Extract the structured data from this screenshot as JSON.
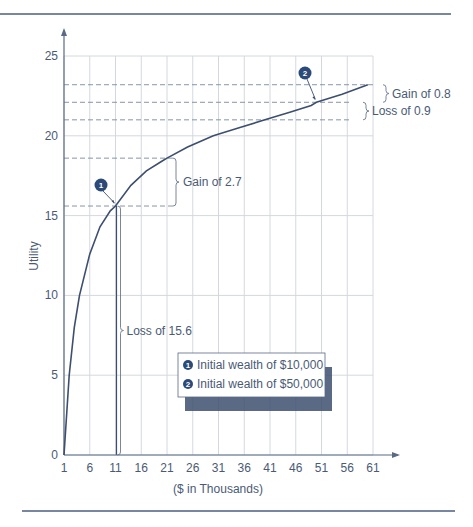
{
  "chart_data": {
    "type": "line",
    "title": "",
    "xlabel": "($ in Thousands)",
    "ylabel": "Utility",
    "xlim": [
      1,
      61
    ],
    "ylim": [
      0,
      25
    ],
    "x_ticks": [
      "1",
      "6",
      "11",
      "16",
      "21",
      "26",
      "31",
      "36",
      "41",
      "46",
      "51",
      "56",
      "61"
    ],
    "y_ticks": [
      "0",
      "5",
      "10",
      "15",
      "20",
      "25"
    ],
    "grid": true,
    "series": [
      {
        "name": "Utility curve",
        "x": [
          1,
          2,
          3,
          4,
          6,
          8,
          10,
          11,
          14,
          17,
          20,
          21,
          25,
          30,
          35,
          40,
          45,
          49,
          50,
          55,
          60
        ],
        "y": [
          0,
          5.0,
          8.0,
          10.0,
          12.6,
          14.3,
          15.3,
          15.6,
          16.9,
          17.8,
          18.4,
          18.6,
          19.3,
          20.0,
          20.5,
          21.0,
          21.5,
          21.9,
          22.1,
          22.6,
          23.2
        ]
      }
    ],
    "reference_lines": [
      {
        "y": 23.2,
        "style": "dashed"
      },
      {
        "y": 22.1,
        "style": "dashed"
      },
      {
        "y": 21.0,
        "style": "dashed"
      },
      {
        "y": 18.6,
        "style": "dashed"
      },
      {
        "y": 15.6,
        "style": "dashed"
      }
    ],
    "annotations": [
      {
        "label": "Gain of 2.7",
        "from": 15.6,
        "to": 18.6
      },
      {
        "label": "Loss of 15.6",
        "from": 0,
        "to": 15.6
      },
      {
        "label": "Gain of 0.8",
        "from": 22.1,
        "to": 23.2
      },
      {
        "label": "Loss of 0.9",
        "from": 21.0,
        "to": 22.1
      }
    ],
    "points": [
      {
        "marker": "1",
        "x": 11,
        "y": 15.6
      },
      {
        "marker": "2",
        "x": 50,
        "y": 22.1
      }
    ],
    "legend": [
      {
        "marker": "1",
        "label": "Initial wealth of $10,000"
      },
      {
        "marker": "2",
        "label": "Initial wealth of $50,000"
      }
    ],
    "legend_position": "inside-lower-right"
  },
  "colors": {
    "line": "#3d4f6e",
    "grid": "#d4d8de",
    "axis": "#5a6a85",
    "badge": "#2c4a78",
    "rule": "#4a5f80"
  }
}
